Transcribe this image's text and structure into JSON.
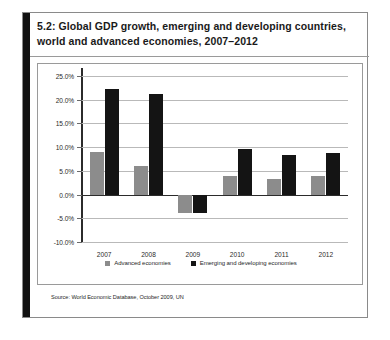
{
  "figure": {
    "caption": "5.2: Global GDP growth, emerging and developing countries, world and advanced economies, 2007–2012",
    "source": "Source: World Economic Database, October 2009, UN"
  },
  "legend": {
    "items": [
      {
        "label": "Advanced economies",
        "color": "#8c8c8c",
        "key": "adv"
      },
      {
        "label": "Emerging and developing economies",
        "color": "#141414",
        "key": "eme"
      }
    ]
  },
  "axis": {
    "y_ticks": [
      "25.0%",
      "20.0%",
      "15.0%",
      "10.0%",
      "5.0%",
      "0.0%",
      "-5.0%",
      "-10.0%"
    ],
    "y_tick_values": [
      25,
      20,
      15,
      10,
      5,
      0,
      -5,
      -10
    ]
  },
  "chart_data": {
    "type": "bar",
    "title": "5.2: Global GDP growth, emerging and developing countries, world and advanced economies, 2007–2012",
    "xlabel": "",
    "ylabel": "",
    "ylim": [
      -10,
      25
    ],
    "ytick_step": 5,
    "grid": true,
    "legend_position": "bottom",
    "categories": [
      "2007",
      "2008",
      "2009",
      "2010",
      "2011",
      "2012"
    ],
    "series": [
      {
        "name": "Advanced economies",
        "color": "#8c8c8c",
        "values": [
          8.9,
          6.0,
          -3.8,
          4.0,
          3.3,
          3.9
        ]
      },
      {
        "name": "Emerging and developing economies",
        "color": "#141414",
        "values": [
          22.3,
          21.3,
          -3.8,
          9.7,
          8.3,
          8.8
        ]
      }
    ],
    "source": "Source: World Economic Database, October 2009, UN"
  }
}
